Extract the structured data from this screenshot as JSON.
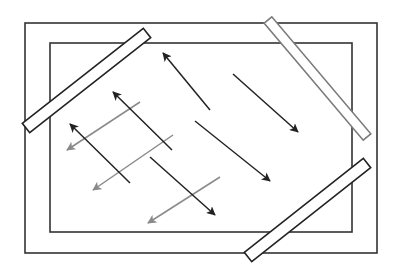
{
  "diagram": {
    "width": 399,
    "height": 266,
    "colors": {
      "background": "#ffffff",
      "dark": "#222222",
      "gray": "#8a8a8a",
      "bar_fill": "#ffffff"
    },
    "frames": [
      {
        "name": "outer-frame",
        "x": 25,
        "y": 23,
        "w": 352,
        "h": 230,
        "stroke": "#333333",
        "width": 1.6
      },
      {
        "name": "inner-frame",
        "x": 50,
        "y": 43,
        "w": 302,
        "h": 189,
        "stroke": "#333333",
        "width": 1.6
      }
    ],
    "bars": [
      {
        "name": "top-left-bar",
        "x1": 147,
        "y1": 33,
        "x2": 26,
        "y2": 128,
        "thickness": 12,
        "stroke": "#222222"
      },
      {
        "name": "top-right-bar",
        "x1": 268,
        "y1": 20,
        "x2": 367,
        "y2": 137,
        "thickness": 10,
        "stroke": "#7a7a7a"
      },
      {
        "name": "bottom-right-bar",
        "x1": 367,
        "y1": 163,
        "x2": 248,
        "y2": 257,
        "thickness": 12,
        "stroke": "#222222"
      }
    ],
    "dark_arrows": [
      {
        "x1": 210,
        "y1": 110,
        "x2": 163,
        "y2": 53
      },
      {
        "x1": 233,
        "y1": 74,
        "x2": 298,
        "y2": 132
      },
      {
        "x1": 172,
        "y1": 150,
        "x2": 113,
        "y2": 92
      },
      {
        "x1": 130,
        "y1": 183,
        "x2": 70,
        "y2": 124
      },
      {
        "x1": 195,
        "y1": 121,
        "x2": 270,
        "y2": 181
      },
      {
        "x1": 150,
        "y1": 157,
        "x2": 215,
        "y2": 215
      }
    ],
    "gray_arrows": [
      {
        "x1": 140,
        "y1": 102,
        "x2": 67,
        "y2": 150
      },
      {
        "x1": 173,
        "y1": 135,
        "x2": 93,
        "y2": 190
      },
      {
        "x1": 220,
        "y1": 177,
        "x2": 148,
        "y2": 223
      }
    ]
  }
}
